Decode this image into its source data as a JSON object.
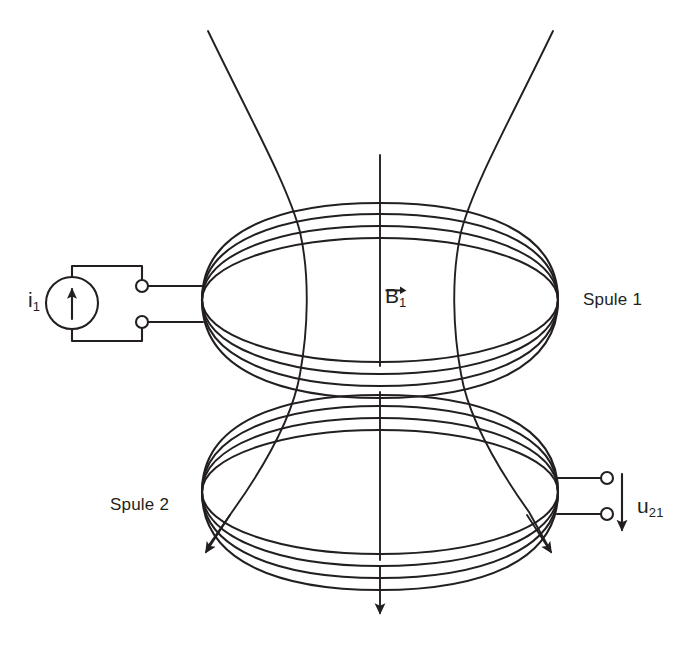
{
  "figure": {
    "width": 694,
    "height": 656,
    "background_color": "#ffffff",
    "stroke_color": "#231f20"
  },
  "labels": {
    "coil1": "Spule 1",
    "coil2": "Spule 2",
    "current_symbol": "i",
    "current_subscript": "1",
    "flux_symbol": "B",
    "flux_subscript": "1",
    "voltage_symbol": "u",
    "voltage_subscript": "21"
  },
  "components": {
    "current_source": {
      "name": "Stromquelle",
      "shape": "circle-with-arrow",
      "center_x": 72,
      "center_y": 303,
      "radius": 26,
      "arrow_direction": "up"
    },
    "coil_top": {
      "name": "Spule 1",
      "center_x": 380,
      "center_y": 300,
      "radius_x": 178,
      "radius_y": 62,
      "turns": 4,
      "turn_spacing": 12
    },
    "coil_bottom": {
      "name": "Spule 2",
      "center_x": 380,
      "center_y": 492,
      "radius_x": 178,
      "radius_y": 62,
      "turns": 4,
      "turn_spacing": 12
    },
    "terminals_left": {
      "name": "Anschlussklemmen Spule 1",
      "count": 2,
      "x": 142,
      "y_top": 286,
      "y_bottom": 322,
      "radius": 6
    },
    "terminals_right": {
      "name": "Anschlussklemmen Spule 2",
      "count": 2,
      "x": 607,
      "y_top": 486,
      "y_bottom": 522,
      "radius": 6
    },
    "field_lines": {
      "name": "Magnetfeldlinien",
      "count": 3,
      "direction": "downward",
      "arrowheads": 3
    },
    "voltage_arrow": {
      "name": "Spannungspfeil u21",
      "x": 620,
      "y_start": 474,
      "y_end": 534,
      "direction": "down"
    }
  }
}
